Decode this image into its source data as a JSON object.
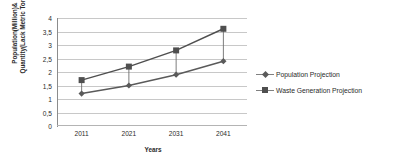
{
  "chart_data": {
    "type": "line",
    "title": "",
    "xlabel": "Years",
    "ylabel": "Population(Million)& Quantity(Lack Metric Tons)",
    "ylabel_lines": [
      "Population(Million)&",
      "Quantity(Lack Metric Tons)"
    ],
    "categories": [
      "2011",
      "2021",
      "2031",
      "2041"
    ],
    "series": [
      {
        "name": "Population Projection",
        "marker": "diamond",
        "color": "#5a5a5a",
        "values": [
          1.2,
          1.5,
          1.9,
          2.4
        ]
      },
      {
        "name": "Waste Generation Projection",
        "marker": "square",
        "color": "#4f4f4f",
        "values": [
          1.7,
          2.2,
          2.8,
          3.6
        ]
      }
    ],
    "ylim": [
      0,
      4
    ],
    "ytick_labels": [
      "0",
      "0,5",
      "1",
      "1,5",
      "2",
      "2,5",
      "3",
      "3,5",
      "4"
    ],
    "ytick_values": [
      0,
      0.5,
      1,
      1.5,
      2,
      2.5,
      3,
      3.5,
      4
    ],
    "grid": true,
    "legend_position": "right",
    "connectors": true
  }
}
